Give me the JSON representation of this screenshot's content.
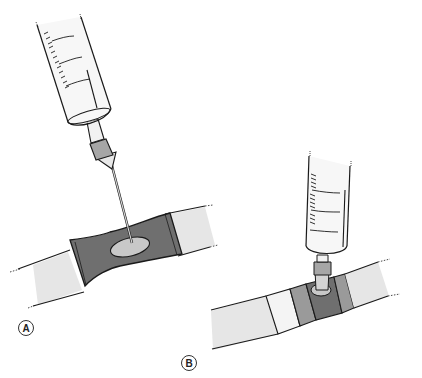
{
  "figure": {
    "panels": [
      {
        "id": "A",
        "label": "A",
        "description": "Syringe needle inserted through sleeve into tubing"
      },
      {
        "id": "B",
        "label": "B",
        "description": "Syringe attached to T-connector port on tubing"
      }
    ]
  },
  "colors": {
    "outline": "#1a1a1a",
    "tube_light": "#e6e6e6",
    "tube_white": "#f4f4f4",
    "sleeve_dark": "#6f6f6f",
    "sleeve_mid": "#9a9a9a",
    "port_light": "#c8c8c8",
    "hub_gray": "#a6a6a6",
    "barrel": "#f7f7f7"
  }
}
